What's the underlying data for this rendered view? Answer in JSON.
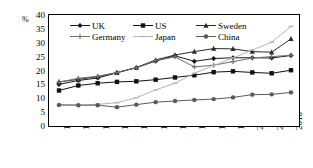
{
  "chart_data": {
    "type": "line",
    "title": "",
    "subtitle": "",
    "xlabel": "",
    "ylabel": "%",
    "ylim": [
      0,
      40
    ],
    "ytick_step": 5,
    "yticks": [
      "40",
      "35",
      "30",
      "25",
      "20",
      "15",
      "10",
      "5",
      "0"
    ],
    "grid": false,
    "legend_position": "top-inside",
    "categories": [
      "1950",
      "1955",
      "1960",
      "1965",
      "1970",
      "1975",
      "1980",
      "1985",
      "1990",
      "1995",
      "2000",
      "2005",
      "2010"
    ],
    "series": [
      {
        "name": "UK",
        "marker": "diamond",
        "color": "#1a1a1a",
        "values": [
          15.0,
          16.4,
          17.3,
          19.2,
          21.0,
          23.4,
          25.3,
          23.3,
          24.3,
          24.6,
          24.6,
          24.5,
          25.4
        ]
      },
      {
        "name": "US",
        "marker": "square",
        "color": "#111111",
        "values": [
          12.8,
          14.6,
          15.4,
          15.9,
          16.1,
          16.7,
          17.5,
          18.3,
          19.4,
          19.7,
          19.3,
          19.0,
          20.1
        ]
      },
      {
        "name": "Sweden",
        "marker": "triangle",
        "color": "#2b2b2b",
        "values": [
          15.9,
          16.8,
          17.8,
          19.2,
          21.1,
          23.8,
          25.6,
          26.8,
          27.9,
          27.8,
          26.8,
          26.6,
          31.4
        ]
      },
      {
        "name": "Germany",
        "marker": "cross",
        "color": "#6e6e6e",
        "values": [
          15.8,
          17.2,
          17.9,
          19.3,
          21.0,
          23.6,
          24.9,
          21.3,
          21.9,
          23.2,
          24.5,
          25.0,
          25.5
        ]
      },
      {
        "name": "Japan",
        "marker": "dash",
        "color": "#b5b5b5",
        "values": [
          7.6,
          7.6,
          7.8,
          8.4,
          10.2,
          13.0,
          15.4,
          19.0,
          21.8,
          24.5,
          27.4,
          30.2,
          35.9
        ]
      },
      {
        "name": "China",
        "marker": "circle",
        "color": "#5a5a5a",
        "values": [
          7.6,
          7.5,
          7.5,
          6.8,
          7.7,
          8.6,
          9.0,
          9.4,
          9.7,
          10.3,
          11.3,
          11.4,
          12.1
        ]
      }
    ]
  },
  "axis": {
    "unit_label": "%"
  },
  "legend": {
    "items": [
      {
        "label": "UK"
      },
      {
        "label": "US"
      },
      {
        "label": "Sweden"
      },
      {
        "label": "Germany"
      },
      {
        "label": "Japan"
      },
      {
        "label": "China"
      }
    ]
  }
}
